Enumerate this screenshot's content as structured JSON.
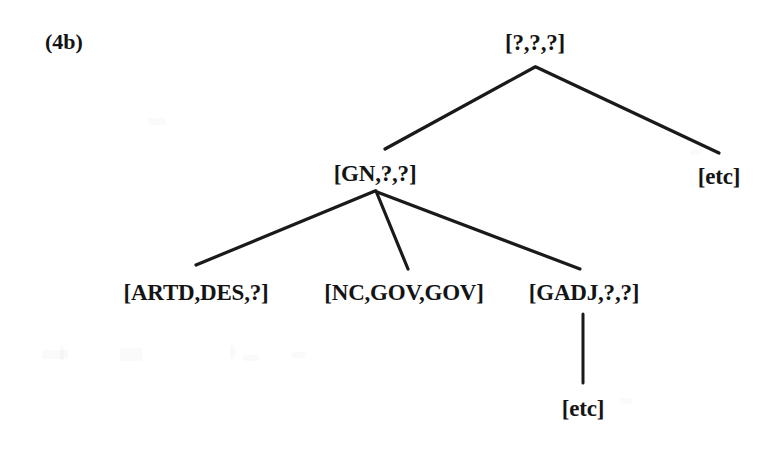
{
  "figure": {
    "example_number": "(4b)",
    "background_color": "#ffffff",
    "ink_color": "#141414",
    "line_color": "#1a1a1a",
    "caption_note": "Feature-percolation tree for a French noun phrase"
  },
  "tree": {
    "type": "constituency-tree",
    "root": {
      "id": "root",
      "label": "[?,?,?]",
      "x": 535,
      "y": 42
    },
    "nodes": [
      {
        "id": "root",
        "label": "[?,?,?]",
        "x": 535,
        "y": 42,
        "depth": 0,
        "parent": null
      },
      {
        "id": "gn",
        "label": "[GN,?,?]",
        "x": 375,
        "y": 173,
        "depth": 1,
        "parent": "root"
      },
      {
        "id": "etc-right",
        "label": "[etc]",
        "x": 719,
        "y": 176,
        "depth": 1,
        "parent": "root"
      },
      {
        "id": "artd",
        "label": "[ARTD,DES,?]",
        "x": 196,
        "y": 292,
        "depth": 2,
        "parent": "gn"
      },
      {
        "id": "nc",
        "label": "[NC,GOV,GOV]",
        "x": 404,
        "y": 292,
        "depth": 2,
        "parent": "gn"
      },
      {
        "id": "gadj",
        "label": "[GADJ,?,?]",
        "x": 584,
        "y": 292,
        "depth": 2,
        "parent": "gn"
      },
      {
        "id": "etc-below",
        "label": "[etc]",
        "x": 583,
        "y": 408,
        "depth": 3,
        "parent": "gadj"
      }
    ],
    "edges": [
      {
        "id": "edge-root-gn",
        "from": "root",
        "to": "gn",
        "x1": 535,
        "y1": 67,
        "x2": 385,
        "y2": 149
      },
      {
        "id": "edge-root-etc",
        "from": "root",
        "to": "etc-right",
        "x1": 536,
        "y1": 67,
        "x2": 719,
        "y2": 153
      },
      {
        "id": "edge-gn-artd",
        "from": "gn",
        "to": "artd",
        "x1": 375,
        "y1": 191,
        "x2": 196,
        "y2": 265
      },
      {
        "id": "edge-gn-nc",
        "from": "gn",
        "to": "nc",
        "x1": 376,
        "y1": 191,
        "x2": 408,
        "y2": 269
      },
      {
        "id": "edge-gn-gadj",
        "from": "gn",
        "to": "gadj",
        "x1": 377,
        "y1": 192,
        "x2": 580,
        "y2": 269
      },
      {
        "id": "edge-gadj-etc",
        "from": "gadj",
        "to": "etc-below",
        "x1": 583,
        "y1": 314,
        "x2": 583,
        "y2": 383
      }
    ]
  }
}
